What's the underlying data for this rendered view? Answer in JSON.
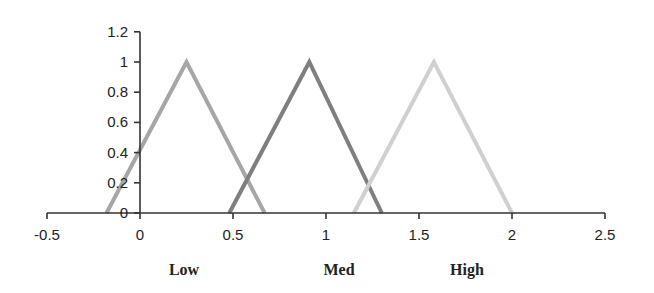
{
  "chart_data": {
    "type": "line",
    "title": "",
    "xlabel": "",
    "ylabel": "",
    "xlim": [
      -0.5,
      2.5
    ],
    "ylim": [
      0,
      1.2
    ],
    "grid": false,
    "legend": "none",
    "x_ticks": [
      {
        "value": -0.5,
        "label": "-0.5"
      },
      {
        "value": 0,
        "label": "0"
      },
      {
        "value": 0.5,
        "label": "0.5"
      },
      {
        "value": 1,
        "label": "1"
      },
      {
        "value": 1.5,
        "label": "1.5"
      },
      {
        "value": 2,
        "label": "2"
      },
      {
        "value": 2.5,
        "label": "2.5"
      }
    ],
    "y_ticks": [
      {
        "value": 0,
        "label": "0"
      },
      {
        "value": 0.2,
        "label": "0.2"
      },
      {
        "value": 0.4,
        "label": "0.4"
      },
      {
        "value": 0.6,
        "label": "0.6"
      },
      {
        "value": 0.8,
        "label": "0.8"
      },
      {
        "value": 1,
        "label": "1"
      },
      {
        "value": 1.2,
        "label": "1.2"
      }
    ],
    "series": [
      {
        "name": "Low",
        "color": "#a6a6a6",
        "x": [
          -0.18,
          0.25,
          0.67
        ],
        "y": [
          0,
          1,
          0
        ]
      },
      {
        "name": "Med",
        "color": "#7f7f7f",
        "x": [
          0.48,
          0.91,
          1.3
        ],
        "y": [
          0,
          1,
          0
        ]
      },
      {
        "name": "High",
        "color": "#d0d0d0",
        "x": [
          1.15,
          1.58,
          2.0
        ],
        "y": [
          0,
          1,
          0
        ]
      }
    ],
    "annotations": [
      {
        "text": "Low",
        "x_px": 184
      },
      {
        "text": "Med",
        "x_px": 339
      },
      {
        "text": "High",
        "x_px": 467
      }
    ]
  }
}
